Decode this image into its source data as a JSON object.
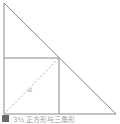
{
  "diagram": {
    "shapes": [
      "right-triangle",
      "inscribed-square",
      "dashed-diagonal"
    ],
    "label": "a",
    "colors": {
      "line": "#8a8a8a",
      "dashed": "#b0b0b0",
      "background": "#ffffff"
    }
  },
  "caption": {
    "icon": "figure-icon",
    "text": "3½ 正方形与三角形"
  }
}
